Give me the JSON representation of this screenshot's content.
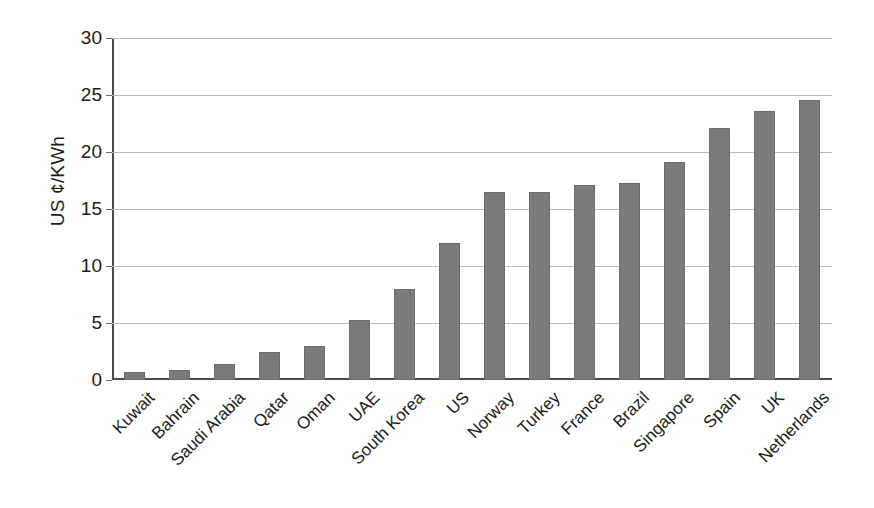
{
  "chart_data": {
    "type": "bar",
    "title": "",
    "xlabel": "",
    "ylabel": "US ¢/KWh",
    "ylim": [
      0,
      30
    ],
    "ytick_values": [
      0,
      5,
      10,
      15,
      20,
      25,
      30
    ],
    "ytick_labels": [
      "0",
      "5",
      "10",
      "15",
      "20",
      "25",
      "30"
    ],
    "grid": true,
    "legend": "none",
    "bar_color": "#7b7b7b",
    "categories": [
      "Kuwait",
      "Bahrain",
      "Saudi Arabia",
      "Qatar",
      "Oman",
      "UAE",
      "South Korea",
      "US",
      "Norway",
      "Turkey",
      "France",
      "Brazil",
      "Singapore",
      "Spain",
      "UK",
      "Netherlands"
    ],
    "values": [
      0.7,
      0.9,
      1.4,
      2.5,
      3.0,
      5.3,
      8.0,
      12.0,
      16.5,
      16.5,
      17.1,
      17.3,
      19.1,
      22.1,
      23.6,
      24.6
    ]
  }
}
